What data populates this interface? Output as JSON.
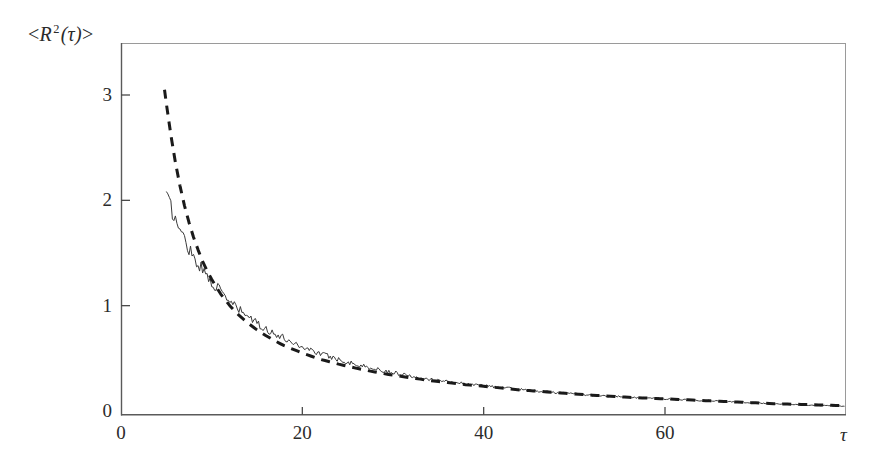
{
  "figure": {
    "background_color": "#ffffff",
    "ink_color": "#2b2b2b"
  },
  "labels": {
    "y_axis_prefix": "<",
    "y_axis_symbol": "R",
    "y_axis_exponent": "2",
    "y_axis_arg": "(τ)",
    "y_axis_suffix": ">",
    "y_axis_full": "<R²(τ)>",
    "x_axis": "τ"
  },
  "chart_data": {
    "type": "line",
    "title": "",
    "xlabel": "τ",
    "ylabel": "<R²(τ)>",
    "xlim": [
      0,
      79.8
    ],
    "ylim": [
      0,
      3.5
    ],
    "xticks": [
      0,
      20,
      40,
      60
    ],
    "yticks": [
      0,
      1,
      2,
      3
    ],
    "xtick_labels": [
      "0",
      "20",
      "40",
      "60"
    ],
    "ytick_labels": [
      "0",
      "1",
      "2",
      "3"
    ],
    "grid": false,
    "legend": null,
    "frame": {
      "left_spine": true,
      "bottom_spine": true,
      "top_spine": "faint",
      "right_spine": "faint"
    },
    "series": [
      {
        "name": "simulated mean square displacement (noisy)",
        "style": "solid",
        "color": "#3a3a3a",
        "linewidth": 1,
        "noise_amplitude": 0.085,
        "x": [
          5.0,
          5.5,
          6.0,
          6.5,
          7.0,
          7.5,
          8.0,
          8.5,
          9.0,
          9.5,
          10.0,
          11.0,
          12.0,
          13.0,
          14.0,
          15.0,
          16.0,
          17.0,
          18.0,
          19.0,
          20.0,
          22.0,
          24.0,
          26.0,
          28.0,
          30.0,
          32.0,
          34.0,
          36.0,
          38.0,
          40.0,
          44.0,
          48.0,
          52.0,
          56.0,
          60.0,
          64.0,
          68.0,
          72.0,
          76.0,
          79.8
        ],
        "y": [
          2.05,
          1.93,
          1.82,
          1.72,
          1.63,
          1.55,
          1.47,
          1.4,
          1.34,
          1.28,
          1.23,
          1.13,
          1.04,
          0.96,
          0.9,
          0.83,
          0.78,
          0.73,
          0.69,
          0.65,
          0.61,
          0.545,
          0.49,
          0.44,
          0.4,
          0.365,
          0.335,
          0.305,
          0.28,
          0.26,
          0.24,
          0.205,
          0.175,
          0.15,
          0.13,
          0.115,
          0.1,
          0.085,
          0.07,
          0.055,
          0.045
        ]
      },
      {
        "name": "theoretical prediction",
        "style": "dashed",
        "color": "#1a1a1a",
        "linewidth": 3,
        "dash_pattern": "9 7",
        "x": [
          4.8,
          5.0,
          5.5,
          6.0,
          6.5,
          7.0,
          7.5,
          8.0,
          8.5,
          9.0,
          9.5,
          10.0,
          11.0,
          12.0,
          13.0,
          14.0,
          15.0,
          16.0,
          17.0,
          18.0,
          19.0,
          20.0,
          22.0,
          24.0,
          26.0,
          28.0,
          30.0,
          32.0,
          34.0,
          36.0,
          38.0,
          40.0,
          44.0,
          48.0,
          52.0,
          56.0,
          60.0,
          64.0,
          68.0,
          72.0,
          76.0,
          79.8
        ],
        "y": [
          3.05,
          2.92,
          2.62,
          2.36,
          2.14,
          1.95,
          1.79,
          1.65,
          1.53,
          1.42,
          1.33,
          1.25,
          1.11,
          1.0,
          0.91,
          0.835,
          0.77,
          0.715,
          0.665,
          0.62,
          0.585,
          0.55,
          0.49,
          0.445,
          0.405,
          0.37,
          0.34,
          0.315,
          0.29,
          0.27,
          0.25,
          0.235,
          0.2,
          0.175,
          0.15,
          0.13,
          0.115,
          0.1,
          0.085,
          0.07,
          0.06,
          0.05
        ]
      }
    ]
  }
}
